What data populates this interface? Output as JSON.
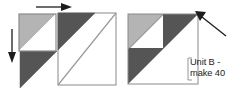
{
  "figure": {
    "palette": {
      "light_gray": "#b4b4b4",
      "dark_gray": "#555555",
      "white": "#ffffff",
      "outline": "#6e6e6e",
      "arrow": "#1d1d1d",
      "text": "#1d1d1d",
      "background": "#ffffff"
    },
    "left_diagram": {
      "name": "exploded-assembly-view",
      "pieces": [
        {
          "id": "small-half-square-triangle-unit",
          "description": "small square, light gray upper-left triangle over white lower-right triangle",
          "x": 18,
          "y": 13,
          "size": 36
        },
        {
          "id": "dark-triangle-bottom-left",
          "description": "dark gray right triangle, right angle at top-left",
          "x": 18,
          "y": 51,
          "size": 36
        },
        {
          "id": "dark-triangle-top-right",
          "description": "dark gray right triangle, right angle at top-left",
          "x": 58,
          "y": 13,
          "size": 36
        },
        {
          "id": "large-base-square",
          "description": "large white square with diagonal crease from bottom-left to top-right",
          "x": 58,
          "y": 13,
          "size": 58
        }
      ],
      "arrows": [
        {
          "id": "arrow-right",
          "direction": "right",
          "from": [
            34,
            7
          ],
          "to": [
            70,
            7
          ]
        },
        {
          "id": "arrow-down",
          "direction": "down",
          "from": [
            12,
            30
          ],
          "to": [
            12,
            62
          ]
        }
      ]
    },
    "right_diagram": {
      "name": "completed-unit-b",
      "square": {
        "x": 128,
        "y": 14,
        "size": 70
      },
      "regions": [
        {
          "id": "light-gray-corner-triangle",
          "shade": "light_gray",
          "description": "light gray triangle in upper-left quadrant"
        },
        {
          "id": "white-inner-triangle",
          "shade": "white",
          "description": "white triangle inside upper-left quadrant"
        },
        {
          "id": "dark-gray-diagonal-band",
          "shade": "dark_gray",
          "description": "dark gray band along the main diagonal"
        },
        {
          "id": "white-lower-right-triangle",
          "shade": "white",
          "description": "white lower-right region"
        }
      ],
      "arrow": {
        "id": "arrow-diagonal-up-left",
        "direction": "up-left",
        "from": [
          228,
          37
        ],
        "to": [
          198,
          14
        ]
      }
    },
    "label": {
      "line1": "Unit B -",
      "line2": "make 40"
    }
  }
}
